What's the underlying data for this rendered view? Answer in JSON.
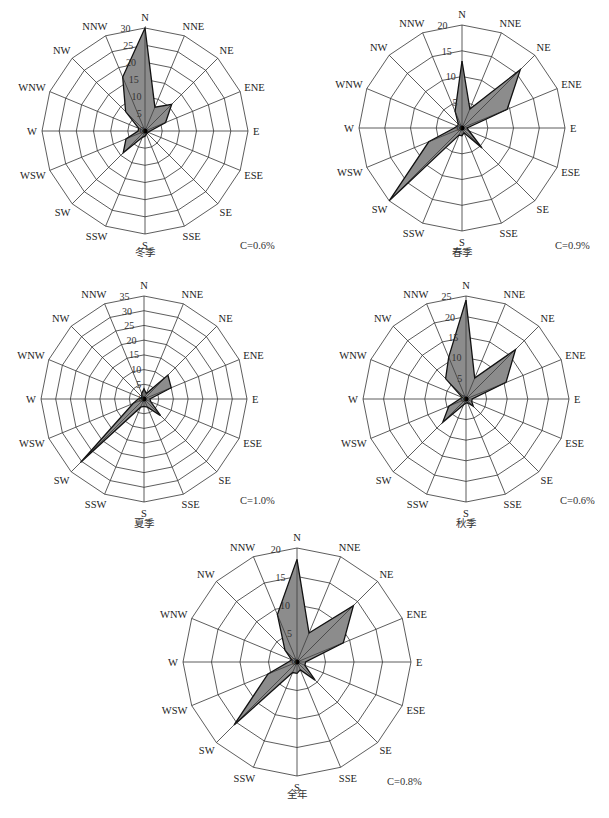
{
  "chart_data": [
    {
      "type": "radar",
      "title": "冬季",
      "calm_label": "C=0.6%",
      "directions": [
        "N",
        "NNE",
        "NE",
        "ENE",
        "E",
        "ESE",
        "SE",
        "SSE",
        "S",
        "SSW",
        "SW",
        "WSW",
        "W",
        "WNW",
        "NW",
        "NNW"
      ],
      "values": [
        30,
        7.5,
        11,
        6.5,
        1.5,
        1,
        1,
        1,
        1.5,
        2,
        9,
        6,
        2,
        2,
        8,
        17
      ],
      "rmax": 30,
      "ticks": [
        0,
        5,
        10,
        15,
        20,
        25,
        30
      ]
    },
    {
      "type": "radar",
      "title": "春季",
      "calm_label": "C=0.9%",
      "directions": [
        "N",
        "NNE",
        "NE",
        "ENE",
        "E",
        "ESE",
        "SE",
        "SSE",
        "S",
        "SSW",
        "SW",
        "WSW",
        "W",
        "WNW",
        "NW",
        "NNW"
      ],
      "values": [
        13,
        4,
        16,
        9.5,
        1,
        1.5,
        5.5,
        1,
        1.5,
        1.5,
        20,
        7,
        1.5,
        1,
        1,
        3.5
      ],
      "rmax": 20,
      "ticks": [
        0,
        5,
        10,
        15,
        20
      ]
    },
    {
      "type": "radar",
      "title": "夏季",
      "calm_label": "C=1.0%",
      "directions": [
        "N",
        "NNE",
        "NE",
        "ENE",
        "E",
        "ESE",
        "SE",
        "SSE",
        "S",
        "SSW",
        "SW",
        "WSW",
        "W",
        "WNW",
        "NW",
        "NNW"
      ],
      "values": [
        3.5,
        2,
        11.5,
        10,
        2,
        2.5,
        8,
        3,
        2.5,
        3,
        30.5,
        4,
        2,
        1,
        1,
        2
      ],
      "rmax": 35,
      "ticks": [
        0,
        5,
        10,
        15,
        20,
        25,
        30,
        35
      ]
    },
    {
      "type": "radar",
      "title": "秋季",
      "calm_label": "C=0.6%",
      "directions": [
        "N",
        "NNE",
        "NE",
        "ENE",
        "E",
        "ESE",
        "SE",
        "SSE",
        "S",
        "SSW",
        "SW",
        "WSW",
        "W",
        "WNW",
        "NW",
        "NNW"
      ],
      "values": [
        24,
        5.5,
        17,
        10.5,
        1.5,
        1.5,
        2.5,
        1,
        1,
        1.5,
        8,
        4.5,
        1.5,
        1,
        7,
        11
      ],
      "rmax": 25,
      "ticks": [
        0,
        5,
        10,
        15,
        20,
        25
      ]
    },
    {
      "type": "radar",
      "title": "全年",
      "calm_label": "C=0.8%",
      "directions": [
        "N",
        "NNE",
        "NE",
        "ENE",
        "E",
        "ESE",
        "SE",
        "SSE",
        "S",
        "SSW",
        "SW",
        "WSW",
        "W",
        "WNW",
        "NW",
        "NNW"
      ],
      "values": [
        18,
        5.5,
        14,
        8.8,
        1.5,
        1.5,
        4.5,
        1.5,
        2,
        2,
        15.6,
        5.5,
        1.5,
        1,
        3,
        9
      ],
      "rmax": 20,
      "ticks": [
        0,
        5,
        10,
        15,
        20
      ]
    }
  ]
}
